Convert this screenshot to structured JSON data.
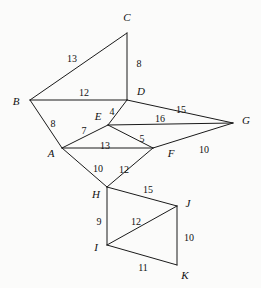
{
  "figure": {
    "width": 261,
    "height": 288,
    "background_color": "#fbfbfa",
    "stroke_color": "#1a1a1a",
    "text_color": "#111111"
  },
  "chart_data": {
    "type": "diagram",
    "subtype": "weighted-undirected-graph",
    "title": "",
    "xlabel": "",
    "ylabel": "",
    "grid": false,
    "legend": "none",
    "nodes": [
      {
        "id": "A",
        "label": "A",
        "x": 62,
        "y": 148,
        "label_x": 51,
        "label_y": 153
      },
      {
        "id": "B",
        "label": "B",
        "x": 30,
        "y": 100,
        "label_x": 16,
        "label_y": 101
      },
      {
        "id": "C",
        "label": "C",
        "x": 127,
        "y": 33,
        "label_x": 127,
        "label_y": 17
      },
      {
        "id": "D",
        "label": "D",
        "x": 127,
        "y": 100,
        "label_x": 141,
        "label_y": 91
      },
      {
        "id": "E",
        "label": "E",
        "x": 108,
        "y": 125,
        "label_x": 98,
        "label_y": 116
      },
      {
        "id": "F",
        "label": "F",
        "x": 153,
        "y": 148,
        "label_x": 171,
        "label_y": 153
      },
      {
        "id": "G",
        "label": "G",
        "x": 233,
        "y": 123,
        "label_x": 246,
        "label_y": 120
      },
      {
        "id": "H",
        "label": "H",
        "x": 107,
        "y": 187,
        "label_x": 96,
        "label_y": 194
      },
      {
        "id": "I",
        "label": "I",
        "x": 107,
        "y": 245,
        "label_x": 96,
        "label_y": 247
      },
      {
        "id": "J",
        "label": "J",
        "x": 177,
        "y": 206,
        "label_x": 188,
        "label_y": 203
      },
      {
        "id": "K",
        "label": "K",
        "x": 177,
        "y": 265,
        "label_x": 185,
        "label_y": 275
      }
    ],
    "edges": [
      {
        "from": "B",
        "to": "C",
        "weight": "13",
        "label_x": 72,
        "label_y": 59
      },
      {
        "from": "C",
        "to": "D",
        "weight": "8",
        "label_x": 139,
        "label_y": 64
      },
      {
        "from": "B",
        "to": "D",
        "weight": "12",
        "label_x": 84,
        "label_y": 93
      },
      {
        "from": "A",
        "to": "B",
        "weight": "8",
        "label_x": 53,
        "label_y": 124
      },
      {
        "from": "D",
        "to": "E",
        "weight": "4",
        "label_x": 112,
        "label_y": 112
      },
      {
        "from": "D",
        "to": "G",
        "weight": "15",
        "label_x": 181,
        "label_y": 110
      },
      {
        "from": "E",
        "to": "G",
        "weight": "16",
        "label_x": 160,
        "label_y": 119
      },
      {
        "from": "A",
        "to": "E",
        "weight": "7",
        "label_x": 84,
        "label_y": 131
      },
      {
        "from": "E",
        "to": "F",
        "weight": "5",
        "label_x": 142,
        "label_y": 139
      },
      {
        "from": "A",
        "to": "F",
        "weight": "13",
        "label_x": 105,
        "label_y": 146
      },
      {
        "from": "F",
        "to": "G",
        "weight": "10",
        "label_x": 204,
        "label_y": 150
      },
      {
        "from": "A",
        "to": "H",
        "weight": "10",
        "label_x": 98,
        "label_y": 169
      },
      {
        "from": "F",
        "to": "H",
        "weight": "12",
        "label_x": 124,
        "label_y": 170
      },
      {
        "from": "H",
        "to": "J",
        "weight": "15",
        "label_x": 148,
        "label_y": 190
      },
      {
        "from": "H",
        "to": "I",
        "weight": "9",
        "label_x": 99,
        "label_y": 222
      },
      {
        "from": "I",
        "to": "J",
        "weight": "12",
        "label_x": 136,
        "label_y": 222
      },
      {
        "from": "J",
        "to": "K",
        "weight": "10",
        "label_x": 189,
        "label_y": 238
      },
      {
        "from": "I",
        "to": "K",
        "weight": "11",
        "label_x": 143,
        "label_y": 268
      }
    ]
  }
}
